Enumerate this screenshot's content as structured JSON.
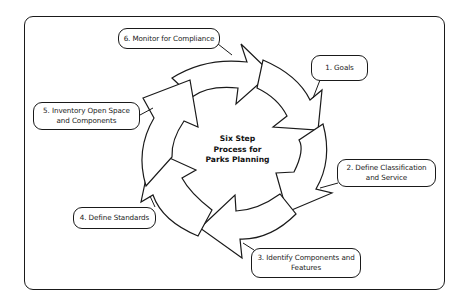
{
  "diagram": {
    "title": "Six Step Process for Parks Planning",
    "title_lines": [
      "Six Step",
      "Process for",
      "Parks Planning"
    ],
    "steps": [
      {
        "number": 1,
        "label": "1. Goals"
      },
      {
        "number": 2,
        "label": "2. Define Classification and Service"
      },
      {
        "number": 3,
        "label": "3. Identify Components and Features"
      },
      {
        "number": 4,
        "label": "4. Define Standards"
      },
      {
        "number": 5,
        "label": "5. Inventory Open Space and Components"
      },
      {
        "number": 6,
        "label": "6. Monitor for Compliance"
      }
    ],
    "colors": {
      "stroke": "#1a1a1a",
      "fill": "#ffffff"
    }
  }
}
